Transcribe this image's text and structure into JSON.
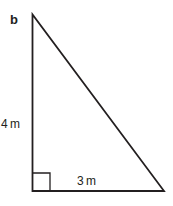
{
  "figure": {
    "label": "b",
    "shape": "right-triangle",
    "vertical_side": "4 m",
    "horizontal_side": "3 m",
    "line_color": "#231f20",
    "right_angle_marker": true
  }
}
